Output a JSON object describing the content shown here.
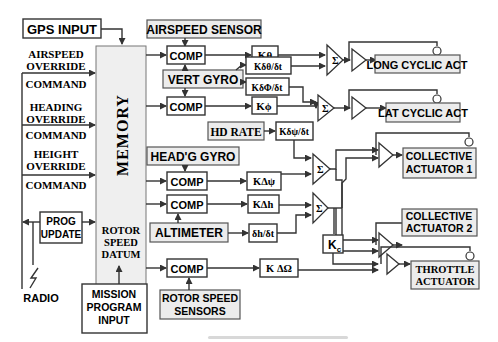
{
  "diagram": {
    "inputs": {
      "gps": "GPS INPUT",
      "airspeed_override": [
        "AIRSPEED",
        "OVERRIDE"
      ],
      "heading_override": [
        "HEADING",
        "OVERRIDE"
      ],
      "height_override": [
        "HEIGHT",
        "OVERRIDE"
      ],
      "command": "COMMAND",
      "prog_update": [
        "PROG",
        "UPDATE"
      ],
      "radio": "RADIO",
      "mission_program": [
        "MISSION",
        "PROGRAM",
        "INPUT"
      ]
    },
    "memory": {
      "label": "MEMORY",
      "rotor_speed_datum": [
        "ROTOR",
        "SPEED",
        "DATUM"
      ]
    },
    "sensors": {
      "airspeed_sensor": "AIRSPEED SENSOR",
      "vert_gyro": "VERT GYRO",
      "hd_rate": "HD RATE",
      "headg_gyro": "HEAD'G GYRO",
      "altimeter": "ALTIMETER",
      "rotor_speed_sensors": [
        "ROTOR SPEED",
        "SENSORS"
      ]
    },
    "comparators": {
      "label": "COMP",
      "count": 5
    },
    "gains": {
      "k_theta": "Kθ",
      "k_dtheta_dt": "Kδθ/δt",
      "k_dphi_dt": "KδΦ/δt",
      "k_phi": "Kϕ",
      "k_dpsi_dt": "Kδψ/δt",
      "k_delta_psi": "KΔψ",
      "k_delta_h": "KΔh",
      "dh_dt": "δh/δt",
      "k_c": "Kc",
      "k_delta_omega": "K ΔΩ"
    },
    "summing_symbol": "Σ",
    "actuators": {
      "long_cyclic": "LONG CYCLIC ACT",
      "lat_cyclic": "LAT CYCLIC ACT",
      "collective_1": [
        "COLLECTIVE",
        "ACTUATOR 1"
      ],
      "collective_2": [
        "COLLECTIVE",
        "ACTUATOR 2"
      ],
      "throttle": [
        "THROTTLE",
        "ACTUATOR"
      ]
    }
  }
}
